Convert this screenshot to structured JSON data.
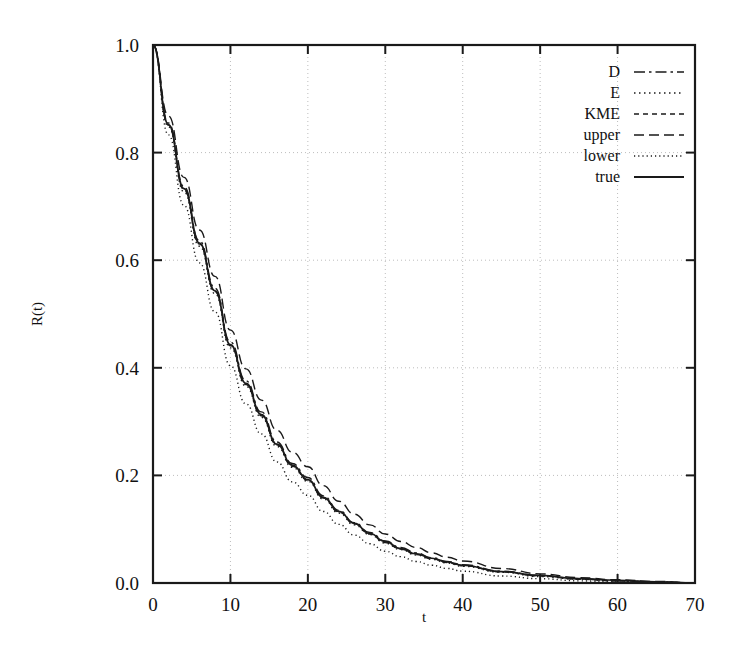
{
  "chart_data": {
    "type": "line",
    "title": "",
    "xlabel": "t",
    "ylabel": "R(t)",
    "xlim": [
      0,
      70
    ],
    "ylim": [
      0.0,
      1.0
    ],
    "grid": true,
    "legend_position": "top-right",
    "xticks": [
      0,
      10,
      20,
      30,
      40,
      50,
      60,
      70
    ],
    "xtick_labels": [
      "0",
      "10",
      "20",
      "30",
      "40",
      "50",
      "60",
      "70"
    ],
    "yticks": [
      0.0,
      0.2,
      0.4,
      0.6,
      0.8,
      1.0
    ],
    "ytick_labels": [
      "0.0",
      "0.2",
      "0.4",
      "0.6",
      "0.8",
      "1.0"
    ],
    "x": [
      0,
      2,
      4,
      6,
      8,
      10,
      12,
      14,
      16,
      18,
      20,
      22,
      24,
      26,
      28,
      30,
      32,
      34,
      36,
      38,
      40,
      45,
      50,
      55,
      60,
      65,
      70
    ],
    "series": [
      {
        "name": "D",
        "dash": "dashdot",
        "color": "#1a1a1a",
        "values": [
          1.0,
          0.855,
          0.737,
          0.636,
          0.548,
          0.448,
          0.376,
          0.318,
          0.262,
          0.222,
          0.196,
          0.162,
          0.135,
          0.112,
          0.094,
          0.078,
          0.066,
          0.056,
          0.047,
          0.04,
          0.034,
          0.022,
          0.014,
          0.008,
          0.004,
          0.002,
          0.0
        ]
      },
      {
        "name": "E",
        "dash": "dotted",
        "color": "#1a1a1a",
        "values": [
          1.0,
          0.848,
          0.727,
          0.626,
          0.538,
          0.437,
          0.366,
          0.308,
          0.254,
          0.215,
          0.189,
          0.156,
          0.13,
          0.108,
          0.09,
          0.074,
          0.062,
          0.052,
          0.044,
          0.037,
          0.031,
          0.02,
          0.012,
          0.007,
          0.004,
          0.002,
          0.0
        ]
      },
      {
        "name": "KME",
        "dash": "dashed-short",
        "color": "#1a1a1a",
        "values": [
          1.0,
          0.851,
          0.731,
          0.63,
          0.542,
          0.441,
          0.369,
          0.311,
          0.257,
          0.217,
          0.191,
          0.158,
          0.132,
          0.11,
          0.091,
          0.075,
          0.063,
          0.053,
          0.045,
          0.038,
          0.032,
          0.021,
          0.013,
          0.007,
          0.004,
          0.002,
          0.0
        ]
      },
      {
        "name": "upper",
        "dash": "dashed-long",
        "color": "#1a1a1a",
        "values": [
          1.0,
          0.868,
          0.754,
          0.656,
          0.57,
          0.47,
          0.398,
          0.34,
          0.284,
          0.243,
          0.216,
          0.181,
          0.152,
          0.128,
          0.108,
          0.091,
          0.077,
          0.066,
          0.056,
          0.048,
          0.041,
          0.027,
          0.017,
          0.01,
          0.006,
          0.003,
          0.0
        ]
      },
      {
        "name": "lower",
        "dash": "fine-dotted",
        "color": "#1a1a1a",
        "values": [
          1.0,
          0.833,
          0.702,
          0.595,
          0.504,
          0.404,
          0.333,
          0.277,
          0.225,
          0.188,
          0.163,
          0.133,
          0.109,
          0.089,
          0.073,
          0.059,
          0.049,
          0.04,
          0.033,
          0.027,
          0.022,
          0.013,
          0.008,
          0.004,
          0.002,
          0.001,
          0.0
        ]
      },
      {
        "name": "true",
        "dash": "solid",
        "color": "#1a1a1a",
        "values": [
          1.0,
          0.852,
          0.733,
          0.632,
          0.543,
          0.443,
          0.371,
          0.313,
          0.258,
          0.219,
          0.192,
          0.159,
          0.133,
          0.111,
          0.092,
          0.077,
          0.064,
          0.054,
          0.046,
          0.039,
          0.033,
          0.021,
          0.014,
          0.008,
          0.005,
          0.002,
          0.0
        ]
      }
    ]
  },
  "legend": {
    "entries": [
      {
        "label": "D"
      },
      {
        "label": "E"
      },
      {
        "label": "KME"
      },
      {
        "label": "upper"
      },
      {
        "label": "lower"
      },
      {
        "label": "true"
      }
    ]
  },
  "style": {
    "grid_color": "#bdbdbd",
    "axis_color": "#1a1a1a",
    "background": "#ffffff"
  }
}
